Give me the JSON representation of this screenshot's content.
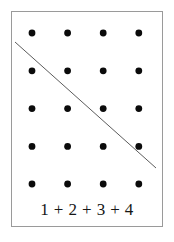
{
  "figure": {
    "name": "triangular-number-dot-array",
    "width": 174,
    "height": 242,
    "background_color": "#ffffff"
  },
  "frame": {
    "border_color": "#9a9a9a",
    "border_width": 1,
    "x": 11,
    "y": 11,
    "width": 152,
    "height": 216
  },
  "caption": {
    "text": "1 + 2 + 3 + 4",
    "color": "#161616"
  },
  "chart_data": {
    "type": "scatter",
    "title": "1 + 2 + 3 + 4",
    "xlabel": "",
    "ylabel": "",
    "grid": false,
    "legend": null,
    "dot_color": "#0b0b0b",
    "dot_radius": 3.4,
    "columns": 4,
    "rows": 5,
    "column_x": [
      32,
      67.6,
      103.2,
      138.8
    ],
    "row_y": [
      33,
      70.8,
      108.6,
      146.4,
      184
    ],
    "points": [
      {
        "x": 32,
        "y": 33
      },
      {
        "x": 67.6,
        "y": 33
      },
      {
        "x": 103.2,
        "y": 33
      },
      {
        "x": 138.8,
        "y": 33
      },
      {
        "x": 32,
        "y": 70.8
      },
      {
        "x": 67.6,
        "y": 70.8
      },
      {
        "x": 103.2,
        "y": 70.8
      },
      {
        "x": 138.8,
        "y": 70.8
      },
      {
        "x": 32,
        "y": 108.6
      },
      {
        "x": 67.6,
        "y": 108.6
      },
      {
        "x": 103.2,
        "y": 108.6
      },
      {
        "x": 138.8,
        "y": 108.6
      },
      {
        "x": 32,
        "y": 146.4
      },
      {
        "x": 67.6,
        "y": 146.4
      },
      {
        "x": 103.2,
        "y": 146.4
      },
      {
        "x": 138.8,
        "y": 146.4
      },
      {
        "x": 32,
        "y": 184
      },
      {
        "x": 67.6,
        "y": 184
      },
      {
        "x": 103.2,
        "y": 184
      },
      {
        "x": 138.8,
        "y": 184
      }
    ],
    "annotations": [
      {
        "type": "line",
        "name": "diagonal-divider",
        "x1": 15,
        "y1": 42,
        "x2": 156,
        "y2": 168,
        "color": "#5c5c5c",
        "width": 1
      }
    ]
  }
}
